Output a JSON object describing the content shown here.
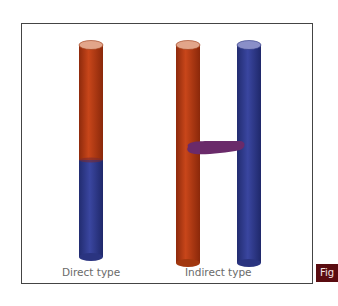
{
  "diagram": {
    "labels": {
      "direct": "Direct type",
      "indirect": "Indirect type"
    },
    "figure_tab": "Fig",
    "colors": {
      "red": "#b63a12",
      "red_top": "#e2a58a",
      "blue": "#2f3a8a",
      "blue_top": "#8a8fc8",
      "bridge": "#6a2a6a",
      "frame": "#444444",
      "tab": "#5a0c10"
    }
  }
}
